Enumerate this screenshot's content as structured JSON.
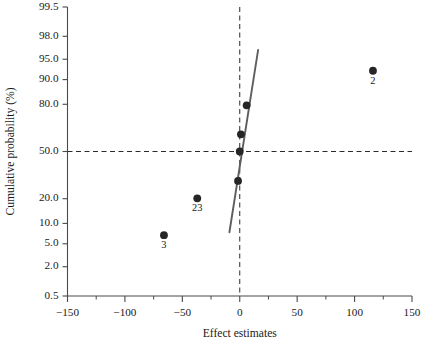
{
  "chart_data": {
    "type": "scatter",
    "title": "",
    "subtitle": "",
    "xlabel": "Effect estimates",
    "ylabel": "Cumulative probability (%)",
    "xlim": [
      -150,
      150
    ],
    "x_ticks": [
      -150,
      -100,
      -50,
      0,
      50,
      100,
      150
    ],
    "x_tick_labels": [
      "−150",
      "−100",
      "−50",
      "0",
      "50",
      "100",
      "150"
    ],
    "x_minor_ticks": [
      -125,
      -75,
      -25,
      25,
      75,
      125
    ],
    "y_scale": "normal-probability",
    "y_ticks": [
      0.5,
      2.0,
      5.0,
      10.0,
      20.0,
      50.0,
      80.0,
      90.0,
      95.0,
      98.0,
      99.5
    ],
    "y_tick_labels": [
      "0.5",
      "2.0",
      "5.0",
      "10.0",
      "20.0",
      "50.0",
      "80.0",
      "90.0",
      "95.0",
      "98.0",
      "99.5"
    ],
    "grid": false,
    "legend": "none",
    "reference_lines": [
      {
        "name": "vertical-zero-line",
        "orientation": "vertical",
        "value": 0,
        "style": "dashed"
      },
      {
        "name": "horizontal-median-line",
        "orientation": "horizontal",
        "value": 50.0,
        "style": "dashed"
      }
    ],
    "fit_line": {
      "name": "normal-fit-line",
      "x_start": -9,
      "y_start": 7.5,
      "x_end": 16,
      "y_end": 96.5
    },
    "points": [
      {
        "label": "3",
        "x": -66,
        "y": 6.8,
        "has_label": true
      },
      {
        "label": "23",
        "x": -37,
        "y": 20.2,
        "has_label": true
      },
      {
        "label": "",
        "x": -1.5,
        "y": 30.0,
        "has_label": false
      },
      {
        "label": "",
        "x": 0.0,
        "y": 50.0,
        "has_label": false
      },
      {
        "label": "",
        "x": 1.0,
        "y": 62.0,
        "has_label": false
      },
      {
        "label": "",
        "x": 6.0,
        "y": 79.5,
        "has_label": false
      },
      {
        "label": "2",
        "x": 116,
        "y": 92.5,
        "has_label": true
      }
    ],
    "colors": {
      "point": "#262626",
      "fit_line": "#5e5e5e",
      "axis": "#4a4a4a",
      "reference": "#2a2a2a",
      "background": "#ffffff"
    }
  }
}
